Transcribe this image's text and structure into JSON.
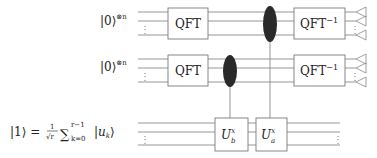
{
  "diagram": {
    "title": "",
    "registers": [
      {
        "id": "reg1",
        "label": "|0⟩",
        "superscript": "⊗n",
        "wires": 3
      },
      {
        "id": "reg2",
        "label": "|0⟩",
        "superscript": "⊗n",
        "wires": 3
      },
      {
        "id": "target",
        "label_lhs": "|1⟩ = ",
        "frac_num": "1",
        "frac_den": "√r",
        "sum": "∑",
        "sum_upper": "r−1",
        "sum_lower": "k=0",
        "ket": "|u",
        "ket_sub": "k",
        "ket_close": "⟩",
        "wires": 3
      }
    ],
    "gates": {
      "qft1": {
        "label": "QFT",
        "register": "reg1"
      },
      "qft2": {
        "label": "QFT",
        "register": "reg2"
      },
      "iqft1": {
        "label": "QFT",
        "sup": "−1",
        "register": "reg1"
      },
      "iqft2": {
        "label": "QFT",
        "sup": "−1",
        "register": "reg2"
      },
      "ub": {
        "label": "U",
        "sup": "x",
        "sub": "b",
        "register": "target",
        "control": "reg2"
      },
      "ua": {
        "label": "U",
        "sup": "x",
        "sub": "a",
        "register": "target",
        "control": "reg1"
      }
    },
    "ellipsis": "⋮",
    "measurements": {
      "reg1": 3,
      "reg2": 3
    }
  }
}
